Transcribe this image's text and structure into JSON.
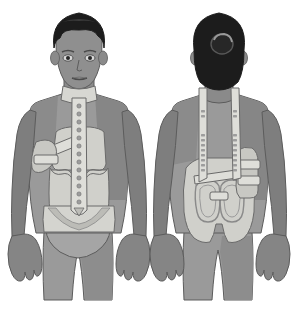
{
  "image": {
    "title": "Spinal orthosis brace worn by patient",
    "description": "Grayscale medical illustration showing two views of a person wearing a thoracolumbosacral spinal brace",
    "background_color": "#ffffff",
    "width": 295,
    "height": 314
  },
  "palette": {
    "background": "#ffffff",
    "hair_dark": "#1c1c1c",
    "hair_highlight": "#3a3a3a",
    "skin_mid": "#9a9a9a",
    "skin_shadow": "#7c7c7c",
    "skin_light": "#adadad",
    "skin_face": "#8f8f8f",
    "brace_light": "#d7d7d2",
    "brace_mid": "#c6c6c1",
    "brace_shadow": "#b0b0ab",
    "strap_light": "#dedeD9",
    "outline": "#5c5c5c",
    "outline_soft": "#8a8a8a",
    "rivet": "#8a8a8a",
    "underwear": "#a5a5a5"
  },
  "panels": [
    {
      "id": "front-view",
      "label": "Front view",
      "x_center": 78,
      "features": [
        "head-with-short-hair",
        "face-with-eyes-nose-mouth",
        "neck-collar",
        "vertical-sternal-strap-with-rivets",
        "diagonal-chest-strap",
        "anterior-body-jacket",
        "pelvic-band",
        "arms-at-sides",
        "hands",
        "legs",
        "underwear"
      ],
      "rivet_count": 14
    },
    {
      "id": "back-view",
      "label": "Back view",
      "x_center": 218,
      "features": [
        "head-with-hair-bun",
        "two-vertical-shoulder-straps-with-slots",
        "posterior-body-jacket",
        "two-rounded-rectangular-pads",
        "horizontal-connector-strap",
        "side-buckle-assembly",
        "arms-at-sides",
        "hands",
        "legs"
      ],
      "strap_slot_count": 18
    }
  ]
}
